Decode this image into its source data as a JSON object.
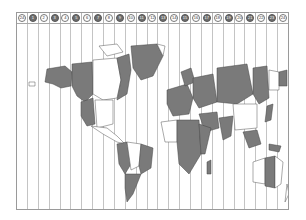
{
  "map": {
    "type": "world-time-zone-map",
    "zone_header": [
      {
        "label": "24",
        "shade": "light"
      },
      {
        "label": "1",
        "shade": "dark"
      },
      {
        "label": "2",
        "shade": "light"
      },
      {
        "label": "3",
        "shade": "dark"
      },
      {
        "label": "4",
        "shade": "light"
      },
      {
        "label": "5",
        "shade": "dark"
      },
      {
        "label": "6",
        "shade": "light"
      },
      {
        "label": "7",
        "shade": "dark"
      },
      {
        "label": "8",
        "shade": "light"
      },
      {
        "label": "9",
        "shade": "dark"
      },
      {
        "label": "10",
        "shade": "light"
      },
      {
        "label": "11",
        "shade": "dark"
      },
      {
        "label": "12",
        "shade": "light"
      },
      {
        "label": "13",
        "shade": "dark"
      },
      {
        "label": "14",
        "shade": "light"
      },
      {
        "label": "15",
        "shade": "dark"
      },
      {
        "label": "16",
        "shade": "light"
      },
      {
        "label": "17",
        "shade": "dark"
      },
      {
        "label": "18",
        "shade": "light"
      },
      {
        "label": "19",
        "shade": "dark"
      },
      {
        "label": "20",
        "shade": "light"
      },
      {
        "label": "21",
        "shade": "dark"
      },
      {
        "label": "22",
        "shade": "light"
      },
      {
        "label": "23",
        "shade": "dark"
      },
      {
        "label": "24",
        "shade": "light"
      }
    ],
    "colors": {
      "dark_zone": "#7a7a7a",
      "light_zone": "#ffffff",
      "grid": "#c4c4c4",
      "border": "#9a9a9a"
    },
    "region_labels": {
      "alaska": "8",
      "canada_west": "9",
      "canada_central": "6",
      "canada_east": "5",
      "greenland": "3",
      "greenland_east": "10",
      "usa_west": "9",
      "usa_central": "6",
      "usa_east": "5",
      "south_america_west": "5",
      "south_america_central": "4",
      "brazil": "3",
      "argentina": "4",
      "europe_west": "12",
      "europe_central": "13",
      "russia_west": "14",
      "russia_central": "18",
      "russia_east": "20",
      "russia_far_east": "22",
      "russia_chukotka": "24",
      "africa_west": "12",
      "africa_central": "13",
      "africa_east": "15",
      "india": "17",
      "china": "20",
      "australia_west": "20",
      "australia_central": "21",
      "australia_east": "22",
      "new_zealand": "24",
      "hawaii": "1"
    }
  }
}
